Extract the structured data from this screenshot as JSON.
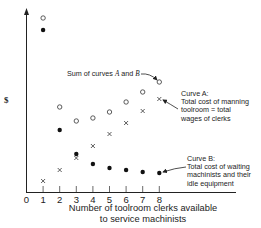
{
  "chart_data": {
    "type": "scatter",
    "title": "",
    "xlabel": "Number of toolroom clerks available to service machinists",
    "xlabel_lines": [
      "Number of toolroom clerks available",
      "to service machinists"
    ],
    "ylabel": "$",
    "x": [
      1,
      2,
      3,
      4,
      5,
      6,
      7,
      8
    ],
    "x_ticks": [
      "0",
      "1",
      "2",
      "3",
      "4",
      "5",
      "6",
      "7",
      "8"
    ],
    "xlim": [
      0,
      8.5
    ],
    "ylim": [
      0,
      185
    ],
    "grid": false,
    "legend_position": "annotations-right",
    "series": [
      {
        "name": "Curve A: Total cost of manning toolroom = total wages of clerks",
        "marker": "x",
        "values": [
          11,
          22,
          34,
          46,
          58,
          69,
          81,
          93
        ]
      },
      {
        "name": "Curve B: Total cost of waiting machinists and their idle equipment",
        "marker": "filled-circle",
        "values": [
          162,
          62,
          38,
          28,
          24,
          22,
          20,
          19
        ]
      },
      {
        "name": "Sum of curves A and B",
        "marker": "open-circle",
        "values": [
          174,
          85,
          71,
          74,
          80,
          90,
          100,
          110
        ]
      }
    ],
    "annotations": [
      {
        "text": "Sum of curves A and B",
        "points_to": {
          "x": 8,
          "series": "Sum of curves A and B"
        }
      },
      {
        "text": "Curve A: Total cost of manning toolroom = total wages of clerks",
        "points_to": {
          "x": 8,
          "series": "Curve A"
        }
      },
      {
        "text": "Curve B: Total cost of waiting machinists and their idle equipment",
        "points_to": {
          "x": 8,
          "series": "Curve B"
        }
      }
    ]
  },
  "labels": {
    "y_axis": "$",
    "x_axis_line1": "Number of toolroom clerks available",
    "x_axis_line2": "to service machinists",
    "sum_annotation_prefix": "Sum of curves ",
    "sum_annotation_A": "A",
    "sum_annotation_mid": " and ",
    "sum_annotation_B": "B",
    "curve_a_title": "Curve A:",
    "curve_a_line1": "Total cost of manning",
    "curve_a_line2": "toolroom = total",
    "curve_a_line3": "wages of clerks",
    "curve_b_title": "Curve B:",
    "curve_b_line1": "Total cost of waiting",
    "curve_b_line2": "machinists and their",
    "curve_b_line3": "idle equipment"
  }
}
